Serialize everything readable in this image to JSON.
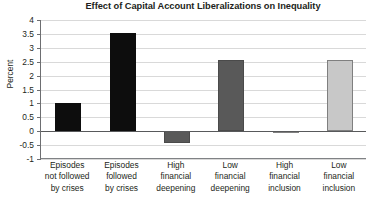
{
  "chart_data": {
    "type": "bar",
    "title": "Effect of Capital Account Liberalizations on Inequality",
    "xlabel": "",
    "ylabel": "Percent",
    "ylim": [
      -1,
      4
    ],
    "yticks": [
      -1,
      -0.5,
      0,
      0.5,
      1,
      1.5,
      2,
      2.5,
      3,
      3.5,
      4
    ],
    "ytick_labels": [
      "-1",
      "-0.5",
      "0",
      "0.5",
      "1",
      "1.5",
      "2",
      "2.5",
      "3",
      "3.5",
      "4"
    ],
    "grid": true,
    "legend": "none",
    "categories": [
      "Episodes not followed by crises",
      "Episodes followed by crises",
      "High financial deepening",
      "Low financial deepening",
      "High financial inclusion",
      "Low financial inclusion"
    ],
    "category_lines": [
      [
        "Episodes",
        "not followed",
        "by crises"
      ],
      [
        "Episodes",
        "followed",
        "by crises"
      ],
      [
        "High",
        "financial",
        "deepening"
      ],
      [
        "Low",
        "financial",
        "deepening"
      ],
      [
        "High",
        "financial",
        "inclusion"
      ],
      [
        "Low",
        "financial",
        "inclusion"
      ]
    ],
    "values": [
      1.0,
      3.55,
      -0.42,
      2.55,
      -0.07,
      2.55
    ],
    "bar_colors": [
      "#0d0d0d",
      "#0d0d0d",
      "#595959",
      "#595959",
      "#808080",
      "#c8c8c8"
    ],
    "bar_borders": [
      "#0d0d0d",
      "#0d0d0d",
      "#4a4a4a",
      "#4a4a4a",
      "#808080",
      "#7f7f7f"
    ]
  }
}
